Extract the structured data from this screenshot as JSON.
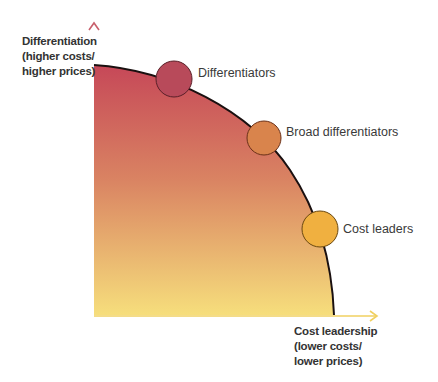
{
  "diagram": {
    "type": "strategy-frontier",
    "y_axis": {
      "lines": [
        "Differentiation",
        "(higher costs/",
        "higher prices)"
      ],
      "color": "#c8606c"
    },
    "x_axis": {
      "lines": [
        "Cost leadership",
        "(lower costs/",
        "lower prices)"
      ],
      "color": "#f0d060"
    },
    "frontier": {
      "stroke": "#1a1010",
      "gradient": [
        "#c64858",
        "#d9805e",
        "#f5dc7a"
      ]
    },
    "points": [
      {
        "label": "Differentiators",
        "color": "#b84a5a",
        "cx": 174,
        "cy": 79,
        "r": 18
      },
      {
        "label": "Broad differentiators",
        "color": "#d9844c",
        "cx": 264,
        "cy": 138,
        "r": 17
      },
      {
        "label": "Cost leaders",
        "color": "#f0b040",
        "cx": 320,
        "cy": 229,
        "r": 18
      }
    ]
  }
}
